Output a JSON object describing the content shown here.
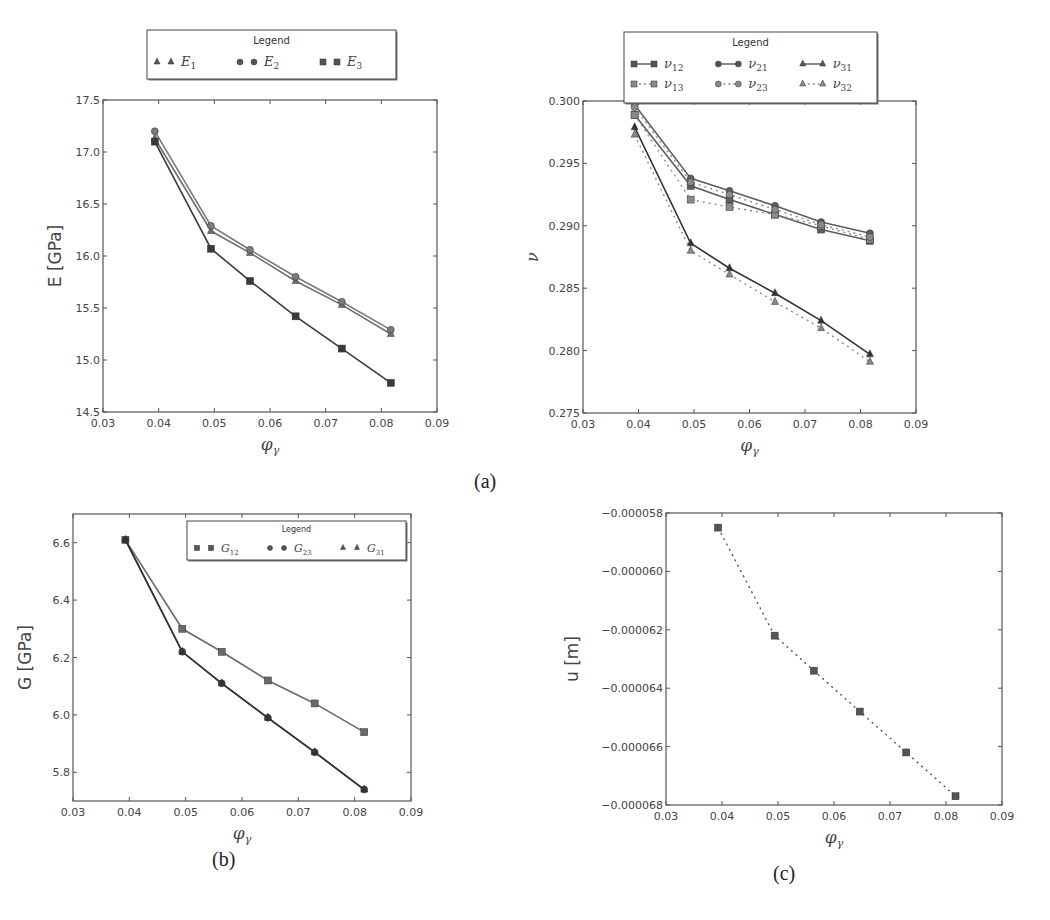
{
  "captions": {
    "a": "(a)",
    "b": "(b)",
    "c": "(c)"
  },
  "chart_data": [
    {
      "id": "E",
      "type": "line",
      "panel": "(a) left",
      "title": "",
      "xlabel": "φ_γ",
      "ylabel": "E [GPa]",
      "xlim": [
        0.03,
        0.09
      ],
      "ylim": [
        14.5,
        17.5
      ],
      "xticks": [
        "0.03",
        "0.04",
        "0.05",
        "0.06",
        "0.07",
        "0.08",
        "0.09"
      ],
      "yticks": [
        "14.5",
        "15.0",
        "15.5",
        "16.0",
        "16.5",
        "17.0",
        "17.5"
      ],
      "grid": false,
      "legend": {
        "title": "Legend",
        "position": "above plot",
        "entries": [
          "E1",
          "E2",
          "E3"
        ]
      },
      "x": [
        0.0393,
        0.0494,
        0.0564,
        0.0646,
        0.0729,
        0.0817
      ],
      "series": [
        {
          "name": "E1",
          "marker": "triangle",
          "style": "solid",
          "color": "#6f6f6f",
          "values": [
            17.13,
            16.24,
            16.03,
            15.76,
            15.53,
            15.25
          ]
        },
        {
          "name": "E2",
          "marker": "circle",
          "style": "solid",
          "color": "#7a7a7a",
          "values": [
            17.2,
            16.29,
            16.06,
            15.8,
            15.56,
            15.29
          ]
        },
        {
          "name": "E3",
          "marker": "square",
          "style": "solid",
          "color": "#3a3a3a",
          "values": [
            17.1,
            16.07,
            15.76,
            15.42,
            15.11,
            14.78
          ]
        }
      ]
    },
    {
      "id": "nu",
      "type": "line",
      "panel": "(a) right",
      "title": "",
      "xlabel": "φ_γ",
      "ylabel": "ν",
      "xlim": [
        0.03,
        0.09
      ],
      "ylim": [
        0.275,
        0.3
      ],
      "xticks": [
        "0.03",
        "0.04",
        "0.05",
        "0.06",
        "0.07",
        "0.08",
        "0.09"
      ],
      "yticks": [
        "0.275",
        "0.280",
        "0.285",
        "0.290",
        "0.295",
        "0.300"
      ],
      "grid": false,
      "legend": {
        "title": "Legend",
        "position": "above plot",
        "entries": [
          "ν12",
          "ν21",
          "ν31",
          "ν13",
          "ν23",
          "ν32"
        ]
      },
      "x": [
        0.0393,
        0.0494,
        0.0564,
        0.0646,
        0.0729,
        0.0817
      ],
      "series": [
        {
          "name": "ν12",
          "marker": "square",
          "style": "solid",
          "color": "#5e5e5e",
          "values": [
            0.2989,
            0.2932,
            0.2921,
            0.2909,
            0.2897,
            0.2888
          ]
        },
        {
          "name": "ν13",
          "marker": "square",
          "style": "dotted",
          "color": "#8a8a8a",
          "values": [
            0.2989,
            0.2921,
            0.2915,
            0.2909,
            0.29,
            0.2889
          ]
        },
        {
          "name": "ν21",
          "marker": "circle",
          "style": "solid",
          "color": "#5e5e5e",
          "values": [
            0.2997,
            0.2938,
            0.2928,
            0.2916,
            0.2903,
            0.2894
          ]
        },
        {
          "name": "ν23",
          "marker": "circle",
          "style": "dotted",
          "color": "#8a8a8a",
          "values": [
            0.2995,
            0.2935,
            0.2925,
            0.2913,
            0.2901,
            0.2891
          ]
        },
        {
          "name": "ν31",
          "marker": "triangle",
          "style": "solid",
          "color": "#333333",
          "values": [
            0.2979,
            0.2886,
            0.2866,
            0.2846,
            0.2824,
            0.2797
          ]
        },
        {
          "name": "ν32",
          "marker": "triangle",
          "style": "dotted",
          "color": "#8a8a8a",
          "values": [
            0.2973,
            0.288,
            0.2861,
            0.2839,
            0.2818,
            0.2791
          ]
        }
      ]
    },
    {
      "id": "G",
      "type": "line",
      "panel": "(b)",
      "title": "",
      "xlabel": "φ_γ",
      "ylabel": "G [GPa]",
      "xlim": [
        0.03,
        0.09
      ],
      "ylim": [
        5.7,
        6.7
      ],
      "xticks": [
        "0.03",
        "0.04",
        "0.05",
        "0.06",
        "0.07",
        "0.08",
        "0.09"
      ],
      "yticks": [
        "5.8",
        "6.0",
        "6.2",
        "6.4",
        "6.6"
      ],
      "grid": false,
      "legend": {
        "title": "Legend",
        "position": "upper right",
        "entries": [
          "G12",
          "G23",
          "G31"
        ]
      },
      "x": [
        0.0393,
        0.0494,
        0.0564,
        0.0646,
        0.0729,
        0.0817
      ],
      "series": [
        {
          "name": "G12",
          "marker": "square",
          "style": "solid",
          "color": "#6a6a6a",
          "values": [
            6.61,
            6.3,
            6.22,
            6.12,
            6.04,
            5.94
          ]
        },
        {
          "name": "G23",
          "marker": "circle",
          "style": "solid",
          "color": "#444444",
          "values": [
            6.61,
            6.22,
            6.11,
            5.99,
            5.87,
            5.74
          ]
        },
        {
          "name": "G31",
          "marker": "triangle",
          "style": "solid",
          "color": "#333333",
          "values": [
            6.61,
            6.22,
            6.11,
            5.99,
            5.87,
            5.74
          ]
        }
      ]
    },
    {
      "id": "u",
      "type": "line",
      "panel": "(c)",
      "title": "",
      "xlabel": "φ_γ",
      "ylabel": "u [m]",
      "xlim": [
        0.03,
        0.09
      ],
      "ylim": [
        -6.8e-05,
        -5.8e-05
      ],
      "xticks": [
        "0.03",
        "0.04",
        "0.05",
        "0.06",
        "0.07",
        "0.08",
        "0.09"
      ],
      "yticks": [
        "-0.000068",
        "-0.000066",
        "-0.000064",
        "-0.000062",
        "-0.000060",
        "-0.000058"
      ],
      "grid": false,
      "legend": null,
      "x": [
        0.0393,
        0.0494,
        0.0564,
        0.0646,
        0.0729,
        0.0817
      ],
      "series": [
        {
          "name": "u",
          "marker": "square",
          "style": "dotted",
          "color": "#555555",
          "values": [
            -5.85e-05,
            -6.22e-05,
            -6.34e-05,
            -6.48e-05,
            -6.62e-05,
            -6.77e-05
          ]
        }
      ]
    }
  ],
  "layout": {
    "E": {
      "left": 103,
      "top": 100,
      "right": 437,
      "bottom": 412
    },
    "nu": {
      "left": 583,
      "top": 101,
      "right": 916,
      "bottom": 413
    },
    "G": {
      "left": 73,
      "top": 514,
      "right": 411,
      "bottom": 801
    },
    "u": {
      "left": 666,
      "top": 513,
      "right": 1002,
      "bottom": 805
    }
  },
  "legends": {
    "E": {
      "title": "Legend",
      "items": [
        {
          "label": "E",
          "sub": "1",
          "marker": "triangle"
        },
        {
          "label": "E",
          "sub": "2",
          "marker": "circle"
        },
        {
          "label": "E",
          "sub": "3",
          "marker": "square"
        }
      ]
    },
    "nu": {
      "title": "Legend",
      "items": [
        {
          "label": "ν",
          "sub": "12",
          "marker": "square",
          "style": "solid"
        },
        {
          "label": "ν",
          "sub": "21",
          "marker": "circle",
          "style": "solid"
        },
        {
          "label": "ν",
          "sub": "31",
          "marker": "triangle",
          "style": "solid"
        },
        {
          "label": "ν",
          "sub": "13",
          "marker": "square",
          "style": "dotted"
        },
        {
          "label": "ν",
          "sub": "23",
          "marker": "circle",
          "style": "dotted"
        },
        {
          "label": "ν",
          "sub": "32",
          "marker": "triangle",
          "style": "dotted"
        }
      ]
    },
    "G": {
      "title": "Legend",
      "items": [
        {
          "label": "G",
          "sub": "12",
          "marker": "square"
        },
        {
          "label": "G",
          "sub": "23",
          "marker": "circle"
        },
        {
          "label": "G",
          "sub": "31",
          "marker": "triangle"
        }
      ]
    }
  }
}
